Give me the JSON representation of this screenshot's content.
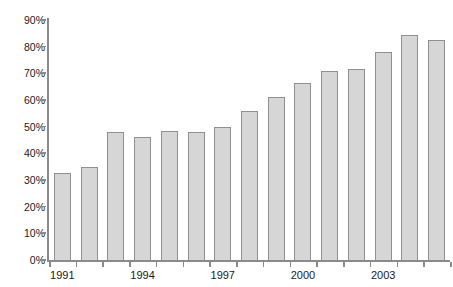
{
  "chart_data": {
    "type": "bar",
    "title": "",
    "subtitle": "",
    "xlabel": "",
    "ylabel": "",
    "categories": [
      "1991",
      "1992",
      "1993",
      "1994",
      "1995",
      "1996",
      "1997",
      "1998",
      "1999",
      "2000",
      "2001",
      "2002",
      "2003",
      "2004",
      "2005"
    ],
    "values": [
      32.5,
      35.0,
      48.0,
      46.0,
      48.5,
      48.0,
      50.0,
      56.0,
      61.0,
      66.5,
      71.0,
      71.5,
      78.0,
      84.5,
      82.5
    ],
    "series": [
      {
        "name": "",
        "values": [
          32.5,
          35.0,
          48.0,
          46.0,
          48.5,
          48.0,
          50.0,
          56.0,
          61.0,
          66.5,
          71.0,
          71.5,
          78.0,
          84.5,
          82.5
        ]
      }
    ],
    "ylim": [
      0,
      90
    ],
    "ytick_values": [
      0,
      10,
      20,
      30,
      40,
      50,
      60,
      70,
      80,
      90
    ],
    "ytick_labels": [
      "0%",
      "10%",
      "20%",
      "30%",
      "40%",
      "50%",
      "60%",
      "70%",
      "80%",
      "90%"
    ],
    "xtick_labels": [
      "1991",
      "1994",
      "1997",
      "2000",
      "2003"
    ],
    "xtick_label_indices": [
      0,
      3,
      6,
      9,
      12
    ],
    "grid": false,
    "legend": null,
    "legend_position": "none",
    "bar_fill_color": "#d6d6d6",
    "bar_border_color": "#8f8f8f",
    "axis_color": "#8a8a8a",
    "text_color": "#1a1a1a",
    "background_color": "#ffffff"
  }
}
